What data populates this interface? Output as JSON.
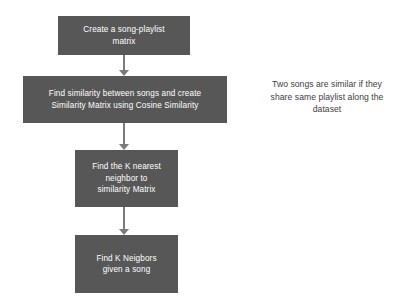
{
  "diagram": {
    "type": "flowchart",
    "background_color": "#ffffff",
    "box_fill_color": "#575757",
    "box_text_color": "#ffffff",
    "connector_color": "#7b7b7b",
    "note_text_color": "#3d3d3d",
    "nodes": [
      {
        "id": "node-1",
        "lines": [
          "Create a song-playlist",
          "matrix"
        ],
        "text": "Create a song-playlist matrix"
      },
      {
        "id": "node-2",
        "lines": [
          "Find similarity between songs and create",
          "Similarity Matrix using Cosine Similarity"
        ],
        "text": "Find similarity between songs and create Similarity Matrix using Cosine Similarity"
      },
      {
        "id": "node-3",
        "lines": [
          "Find the K nearest",
          "neighbor to",
          "similarity Matrix"
        ],
        "text": "Find the K nearest neighbor to similarity Matrix"
      },
      {
        "id": "node-4",
        "lines": [
          "Find K Neigbors",
          "given a song"
        ],
        "text": "Find K Neigbors given a song"
      }
    ],
    "connectors": [
      {
        "id": "arrow-1",
        "from": "node-1",
        "to": "node-2",
        "icon": "arrow-down-icon"
      },
      {
        "id": "arrow-2",
        "from": "node-2",
        "to": "node-3",
        "icon": "arrow-down-icon"
      },
      {
        "id": "arrow-3",
        "from": "node-3",
        "to": "node-4",
        "icon": "arrow-down-icon"
      }
    ],
    "annotation": {
      "lines": [
        "Two songs are similar if they",
        "share same playlist along the",
        "dataset"
      ],
      "text": "Two songs are similar if they share same playlist along the dataset"
    }
  }
}
